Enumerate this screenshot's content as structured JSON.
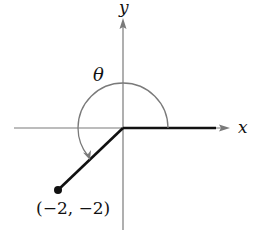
{
  "diagram": {
    "type": "angle-in-standard-position",
    "axes": {
      "x_label": "x",
      "y_label": "y"
    },
    "angle_label": "θ",
    "terminal_point": {
      "x": -2,
      "y": -2,
      "label": "(−2, −2)"
    },
    "colors": {
      "axes": "#7a7a7a",
      "arc": "#7a7a7a",
      "sides": "#111111"
    }
  }
}
